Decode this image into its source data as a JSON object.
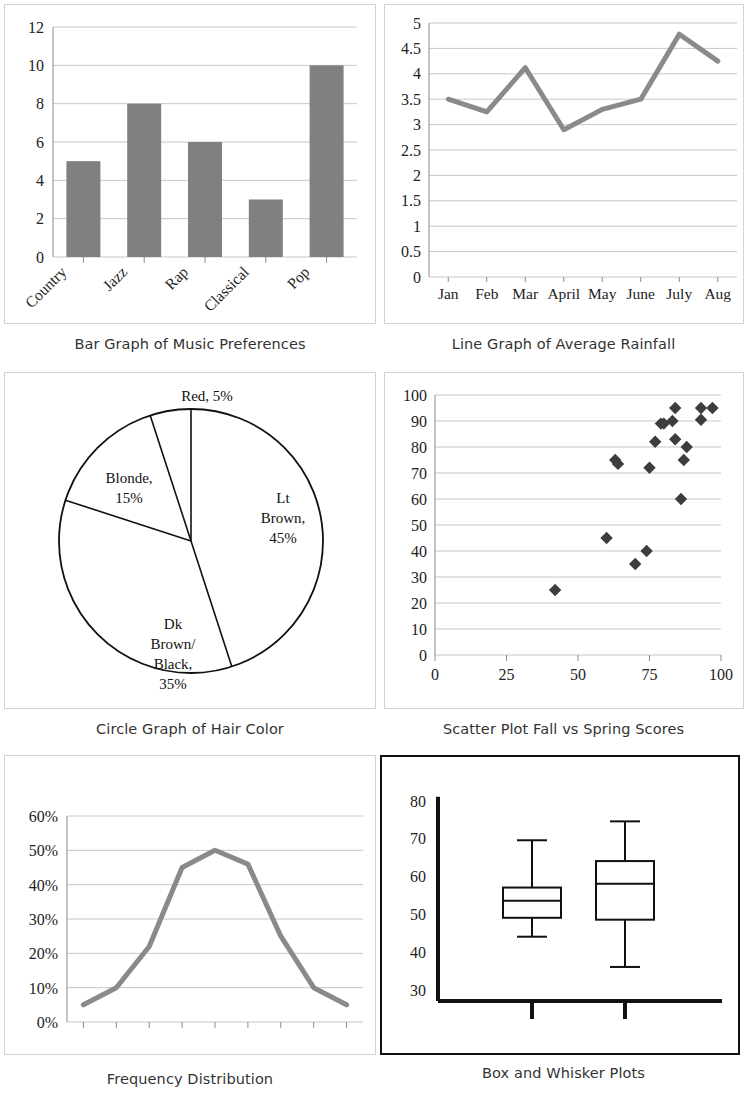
{
  "panels": {
    "bar": {
      "caption": "Bar Graph of Music Preferences",
      "yticks": [
        "0",
        "2",
        "4",
        "6",
        "8",
        "10",
        "12"
      ],
      "categories": [
        "Country",
        "Jazz",
        "Rap",
        "Classical",
        "Pop"
      ]
    },
    "line": {
      "caption": "Line Graph of Average Rainfall",
      "yticks": [
        "0",
        "0.5",
        "1",
        "1.5",
        "2",
        "2.5",
        "3",
        "3.5",
        "4",
        "4.5",
        "5"
      ],
      "xticks": [
        "Jan",
        "Feb",
        "Mar",
        "April",
        "May",
        "June",
        "July",
        "Aug"
      ]
    },
    "pie": {
      "caption": "Circle Graph of Hair Color",
      "labels": [
        "Red, 5%",
        "Blonde,|15%",
        "Lt|Brown,|45%",
        "Dk|Brown/|Black,|35%"
      ]
    },
    "scatter": {
      "caption": "Scatter Plot Fall vs Spring Scores",
      "yticks": [
        "0",
        "10",
        "20",
        "30",
        "40",
        "50",
        "60",
        "70",
        "80",
        "90",
        "100"
      ],
      "xticks": [
        "0",
        "25",
        "50",
        "75",
        "100"
      ]
    },
    "freq": {
      "caption": "Frequency Distribution",
      "yticks": [
        "0%",
        "10%",
        "20%",
        "30%",
        "40%",
        "50%",
        "60%"
      ]
    },
    "box": {
      "caption": "Box and Whisker Plots",
      "yticks": [
        "30",
        "40",
        "50",
        "60",
        "70",
        "80"
      ]
    }
  },
  "chart_data": [
    {
      "type": "bar",
      "title": "Bar Graph of Music Preferences",
      "categories": [
        "Country",
        "Jazz",
        "Rap",
        "Classical",
        "Pop"
      ],
      "values": [
        5,
        8,
        6,
        3,
        10
      ],
      "xlabel": "",
      "ylabel": "",
      "ylim": [
        0,
        12
      ],
      "ytick_step": 2,
      "grid": true,
      "legend": "none",
      "bar_color": "#808080"
    },
    {
      "type": "line",
      "title": "Line Graph of Average Rainfall",
      "categories": [
        "Jan",
        "Feb",
        "Mar",
        "April",
        "May",
        "June",
        "July",
        "Aug"
      ],
      "values": [
        3.5,
        3.25,
        4.12,
        2.9,
        3.3,
        3.5,
        4.78,
        4.25
      ],
      "xlabel": "",
      "ylabel": "",
      "ylim": [
        0,
        5
      ],
      "ytick_step": 0.5,
      "grid": true,
      "legend": "none",
      "line_color": "#8a8a8a"
    },
    {
      "type": "pie",
      "title": "Circle Graph of Hair Color",
      "labels": [
        "Lt Brown",
        "Dk Brown/Black",
        "Blonde",
        "Red"
      ],
      "values": [
        45,
        35,
        15,
        5
      ],
      "unit": "%",
      "legend": "labels-on-slices",
      "slice_fill": "#ffffff",
      "slice_stroke": "#111111"
    },
    {
      "type": "scatter",
      "title": "Scatter Plot Fall vs Spring Scores",
      "xlabel": "",
      "ylabel": "",
      "xlim": [
        0,
        100
      ],
      "ylim": [
        0,
        100
      ],
      "xtick_step": 25,
      "ytick_step": 10,
      "grid": true,
      "legend": "none",
      "marker": "diamond",
      "marker_color": "#3d3d3d",
      "points": [
        [
          42,
          25
        ],
        [
          60,
          45
        ],
        [
          63,
          75
        ],
        [
          64,
          73.5
        ],
        [
          70,
          35
        ],
        [
          74,
          40
        ],
        [
          75,
          72
        ],
        [
          77,
          82
        ],
        [
          79,
          89
        ],
        [
          80,
          89
        ],
        [
          83,
          90
        ],
        [
          84,
          95
        ],
        [
          84,
          83
        ],
        [
          86,
          60
        ],
        [
          87,
          75
        ],
        [
          88,
          80
        ],
        [
          93,
          95
        ],
        [
          93,
          90.5
        ],
        [
          97,
          95
        ]
      ]
    },
    {
      "type": "line",
      "title": "Frequency Distribution",
      "x": [
        1,
        2,
        3,
        4,
        5,
        6,
        7,
        8,
        9
      ],
      "values": [
        5,
        10,
        22,
        45,
        50,
        46,
        25,
        10,
        5
      ],
      "unit": "%",
      "xlabel": "",
      "ylabel": "",
      "ylim": [
        0,
        60
      ],
      "ytick_step": 10,
      "grid": true,
      "legend": "none",
      "line_color": "#8a8a8a"
    },
    {
      "type": "boxplot",
      "title": "Box and Whisker Plots",
      "ylim": [
        27,
        82
      ],
      "ytick_step": 10,
      "yticks": [
        30,
        40,
        50,
        60,
        70,
        80
      ],
      "grid": false,
      "legend": "none",
      "boxes": [
        {
          "name": "Box 1",
          "min": 44,
          "q1": 49,
          "median": 53.5,
          "q3": 57,
          "max": 69.5
        },
        {
          "name": "Box 2",
          "min": 36,
          "q1": 48.5,
          "median": 58,
          "q3": 64,
          "max": 74.5
        }
      ]
    }
  ]
}
